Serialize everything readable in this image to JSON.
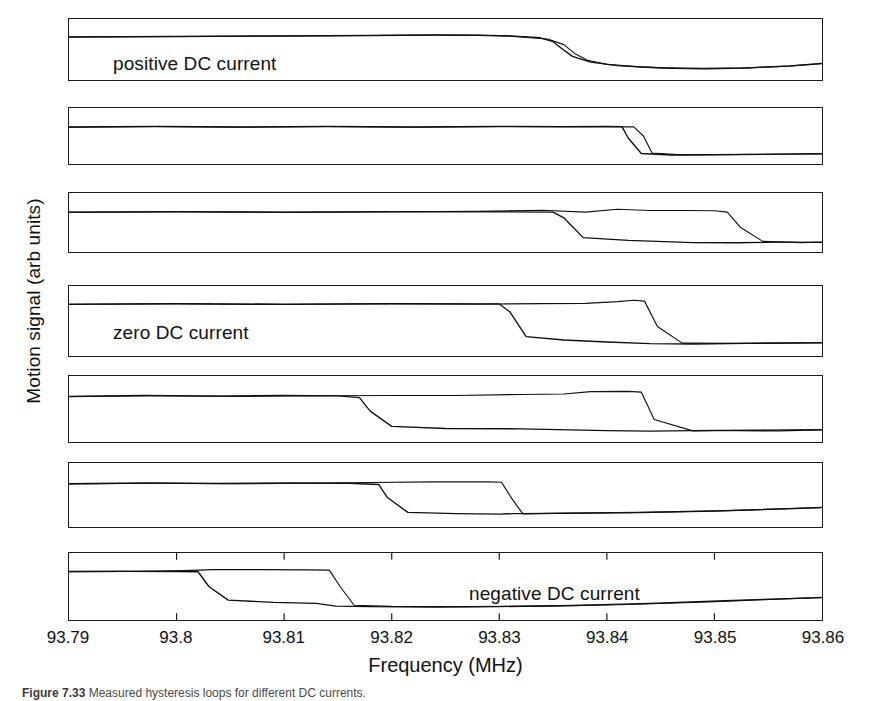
{
  "figure": {
    "y_axis_label": "Motion signal (arb units)",
    "x_axis_label": "Frequency (MHz)",
    "caption_number": "Figure 7.33",
    "caption_text": "Measured hysteresis loops for different DC currents."
  },
  "axis": {
    "x_min": 93.79,
    "x_max": 93.86,
    "x_ticks": [
      93.79,
      93.8,
      93.81,
      93.82,
      93.83,
      93.84,
      93.85,
      93.86
    ],
    "x_tick_labels": [
      "93.79",
      "93.8",
      "93.81",
      "93.82",
      "93.83",
      "93.84",
      "93.85",
      "93.86"
    ]
  },
  "panels": [
    {
      "index": 1,
      "label": "positive DC current",
      "label_x": 44,
      "label_y": 34,
      "top": 18,
      "height": 63,
      "down_transition": 93.8355,
      "up_transition": 93.8365
    },
    {
      "index": 2,
      "label": "",
      "label_x": 0,
      "label_y": 0,
      "top": 107,
      "height": 58,
      "down_transition": 93.8415,
      "up_transition": 93.8435
    },
    {
      "index": 3,
      "label": "",
      "label_x": 0,
      "label_y": 0,
      "top": 192,
      "height": 61,
      "down_transition": 93.8358,
      "up_transition": 93.8513
    },
    {
      "index": 4,
      "label": "zero DC current",
      "label_x": 44,
      "label_y": 36,
      "top": 285,
      "height": 72,
      "down_transition": 93.831,
      "up_transition": 93.8437
    },
    {
      "index": 5,
      "label": "",
      "label_x": 0,
      "label_y": 0,
      "top": 375,
      "height": 68,
      "down_transition": 93.8173,
      "up_transition": 93.843
    },
    {
      "index": 6,
      "label": "",
      "label_x": 0,
      "label_y": 0,
      "top": 462,
      "height": 66,
      "down_transition": 93.819,
      "up_transition": 93.8305
    },
    {
      "index": 7,
      "label": "negative DC current",
      "label_x": 400,
      "label_y": 30,
      "top": 552,
      "height": 69,
      "down_transition": 93.8025,
      "up_transition": 93.8145
    }
  ],
  "chart_data": {
    "type": "line",
    "title": "",
    "xlabel": "Frequency (MHz)",
    "ylabel": "Motion signal (arb units)",
    "xlim": [
      93.79,
      93.86
    ],
    "grid": false,
    "legend": "none",
    "panels": [
      {
        "name": "positive DC current",
        "label": "positive DC current",
        "down_sweep_drop_MHz": 93.8355,
        "up_sweep_jump_MHz": 93.8365,
        "loop_width_MHz": 0.001,
        "series": [
          {
            "name": "down-sweep",
            "x": [
              93.79,
              93.8,
              93.81,
              93.818,
              93.824,
              93.828,
              93.831,
              93.8338,
              93.835,
              93.8358,
              93.8368,
              93.8385,
              93.841,
              93.845,
              93.849,
              93.853,
              93.857,
              93.86
            ],
            "y": [
              0.76,
              0.77,
              0.78,
              0.79,
              0.8,
              0.795,
              0.78,
              0.74,
              0.66,
              0.52,
              0.36,
              0.24,
              0.17,
              0.12,
              0.105,
              0.12,
              0.165,
              0.215
            ]
          },
          {
            "name": "up-sweep",
            "x": [
              93.79,
              93.8,
              93.81,
              93.818,
              93.824,
              93.828,
              93.831,
              93.8345,
              93.836,
              93.837,
              93.8382,
              93.84,
              93.843,
              93.847,
              93.852,
              93.857,
              93.86
            ],
            "y": [
              0.755,
              0.765,
              0.775,
              0.785,
              0.795,
              0.79,
              0.775,
              0.715,
              0.6,
              0.42,
              0.28,
              0.195,
              0.145,
              0.115,
              0.115,
              0.16,
              0.21
            ]
          }
        ]
      },
      {
        "name": "panel-2",
        "label": "",
        "down_sweep_drop_MHz": 93.8415,
        "up_sweep_jump_MHz": 93.8435,
        "loop_width_MHz": 0.002,
        "series": [
          {
            "name": "down-sweep",
            "x": [
              93.79,
              93.798,
              93.806,
              93.814,
              93.822,
              93.83,
              93.836,
              93.84,
              93.8414,
              93.842,
              93.8432,
              93.846,
              93.852,
              93.86
            ],
            "y": [
              0.7,
              0.715,
              0.7,
              0.715,
              0.7,
              0.715,
              0.71,
              0.715,
              0.71,
              0.45,
              0.11,
              0.075,
              0.085,
              0.1
            ]
          },
          {
            "name": "up-sweep",
            "x": [
              93.79,
              93.798,
              93.806,
              93.814,
              93.822,
              93.83,
              93.838,
              93.8425,
              93.8434,
              93.8442,
              93.847,
              93.853,
              93.86
            ],
            "y": [
              0.695,
              0.71,
              0.695,
              0.71,
              0.695,
              0.71,
              0.705,
              0.705,
              0.5,
              0.12,
              0.08,
              0.09,
              0.105
            ]
          }
        ]
      },
      {
        "name": "panel-3",
        "label": "",
        "down_sweep_drop_MHz": 93.8358,
        "up_sweep_jump_MHz": 93.8513,
        "loop_width_MHz": 0.0155,
        "series": [
          {
            "name": "down-sweep",
            "x": [
              93.79,
              93.8,
              93.81,
              93.82,
              93.83,
              93.835,
              93.836,
              93.8378,
              93.842,
              93.848,
              93.852,
              93.856,
              93.86
            ],
            "y": [
              0.72,
              0.73,
              0.72,
              0.73,
              0.725,
              0.72,
              0.6,
              0.18,
              0.12,
              0.075,
              0.07,
              0.085,
              0.08
            ]
          },
          {
            "name": "up-sweep",
            "x": [
              93.79,
              93.8,
              93.81,
              93.82,
              93.828,
              93.834,
              93.838,
              93.841,
              93.844,
              93.847,
              93.85,
              93.8512,
              93.8524,
              93.8545,
              93.858,
              93.86
            ],
            "y": [
              0.715,
              0.725,
              0.715,
              0.725,
              0.735,
              0.76,
              0.72,
              0.78,
              0.755,
              0.755,
              0.75,
              0.72,
              0.4,
              0.1,
              0.075,
              0.085
            ]
          }
        ]
      },
      {
        "name": "zero DC current",
        "label": "zero DC current",
        "down_sweep_drop_MHz": 93.831,
        "up_sweep_jump_MHz": 93.8437,
        "loop_width_MHz": 0.0127,
        "series": [
          {
            "name": "down-sweep",
            "x": [
              93.79,
              93.8,
              93.81,
              93.82,
              93.83,
              93.831,
              93.8325,
              93.836,
              93.84,
              93.844,
              93.848,
              93.853,
              93.86
            ],
            "y": [
              0.8,
              0.81,
              0.8,
              0.81,
              0.805,
              0.66,
              0.22,
              0.16,
              0.125,
              0.095,
              0.09,
              0.1,
              0.11
            ]
          },
          {
            "name": "up-sweep",
            "x": [
              93.79,
              93.8,
              93.81,
              93.82,
              93.828,
              93.834,
              93.838,
              93.841,
              93.8425,
              93.8435,
              93.8447,
              93.847,
              93.852,
              93.86
            ],
            "y": [
              0.795,
              0.805,
              0.795,
              0.805,
              0.8,
              0.81,
              0.815,
              0.845,
              0.87,
              0.855,
              0.4,
              0.105,
              0.1,
              0.115
            ]
          }
        ]
      },
      {
        "name": "panel-5",
        "label": "",
        "down_sweep_drop_MHz": 93.8173,
        "up_sweep_jump_MHz": 93.843,
        "loop_width_MHz": 0.0257,
        "series": [
          {
            "name": "down-sweep",
            "x": [
              93.79,
              93.797,
              93.804,
              93.81,
              93.815,
              93.817,
              93.818,
              93.82,
              93.825,
              93.832,
              93.84,
              93.844,
              93.85,
              93.856,
              93.86
            ],
            "y": [
              0.74,
              0.755,
              0.745,
              0.755,
              0.75,
              0.715,
              0.46,
              0.17,
              0.13,
              0.125,
              0.09,
              0.08,
              0.095,
              0.085,
              0.105
            ]
          },
          {
            "name": "up-sweep",
            "x": [
              93.79,
              93.798,
              93.806,
              93.814,
              93.82,
              93.826,
              93.832,
              93.836,
              93.8385,
              93.842,
              93.8432,
              93.8444,
              93.848,
              93.854,
              93.86
            ],
            "y": [
              0.735,
              0.75,
              0.74,
              0.75,
              0.755,
              0.755,
              0.775,
              0.785,
              0.83,
              0.835,
              0.82,
              0.3,
              0.085,
              0.1,
              0.11
            ]
          }
        ]
      },
      {
        "name": "panel-6",
        "label": "",
        "down_sweep_drop_MHz": 93.819,
        "up_sweep_jump_MHz": 93.8305,
        "loop_width_MHz": 0.0115,
        "series": [
          {
            "name": "down-sweep",
            "x": [
              93.79,
              93.797,
              93.804,
              93.811,
              93.816,
              93.8188,
              93.8196,
              93.8215,
              93.826,
              93.83,
              93.8312,
              93.836,
              93.843,
              93.85,
              93.856,
              93.86
            ],
            "y": [
              0.72,
              0.735,
              0.725,
              0.735,
              0.73,
              0.705,
              0.45,
              0.16,
              0.135,
              0.125,
              0.135,
              0.14,
              0.155,
              0.185,
              0.225,
              0.255
            ]
          },
          {
            "name": "up-sweep",
            "x": [
              93.79,
              93.798,
              93.806,
              93.812,
              93.818,
              93.824,
              93.829,
              93.8302,
              93.8312,
              93.8322,
              93.836,
              93.843,
              93.851,
              93.86
            ],
            "y": [
              0.715,
              0.73,
              0.72,
              0.73,
              0.745,
              0.755,
              0.755,
              0.75,
              0.42,
              0.13,
              0.145,
              0.16,
              0.195,
              0.255
            ]
          }
        ]
      },
      {
        "name": "negative DC current",
        "label": "negative DC current",
        "down_sweep_drop_MHz": 93.8025,
        "up_sweep_jump_MHz": 93.8145,
        "loop_width_MHz": 0.012,
        "series": [
          {
            "name": "down-sweep",
            "x": [
              93.79,
              93.795,
              93.8,
              93.802,
              93.803,
              93.8048,
              93.809,
              93.813,
              93.8148,
              93.818,
              93.824,
              93.83,
              93.837,
              93.844,
              93.851,
              93.857,
              93.86
            ],
            "y": [
              0.78,
              0.785,
              0.78,
              0.775,
              0.5,
              0.245,
              0.205,
              0.185,
              0.135,
              0.125,
              0.115,
              0.125,
              0.145,
              0.185,
              0.235,
              0.275,
              0.295
            ]
          },
          {
            "name": "up-sweep",
            "x": [
              93.79,
              93.796,
              93.8015,
              93.8035,
              93.808,
              93.812,
              93.8142,
              93.8152,
              93.8165,
              93.82,
              93.827,
              93.834,
              93.842,
              93.85,
              93.857,
              93.86
            ],
            "y": [
              0.775,
              0.78,
              0.8,
              0.815,
              0.815,
              0.81,
              0.805,
              0.5,
              0.15,
              0.13,
              0.125,
              0.135,
              0.165,
              0.215,
              0.275,
              0.295
            ]
          }
        ]
      }
    ]
  }
}
